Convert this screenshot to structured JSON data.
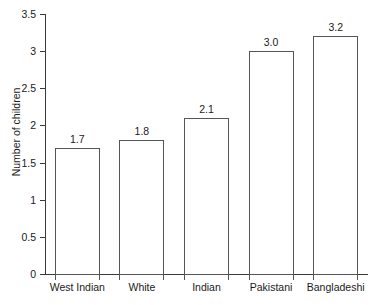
{
  "chart_data": {
    "type": "bar",
    "title": "",
    "xlabel": "",
    "ylabel": "Number of children",
    "categories": [
      "West Indian",
      "White",
      "Indian",
      "Pakistani",
      "Bangladeshi"
    ],
    "values": [
      1.7,
      1.8,
      2.1,
      3.0,
      3.2
    ],
    "value_labels": [
      "1.7",
      "1.8",
      "2.1",
      "3.0",
      "3.2"
    ],
    "ylim": [
      0,
      3.5
    ],
    "ytick_labels": [
      "0",
      "0.5",
      "1",
      "1.5",
      "2",
      "2.5",
      "3",
      "3.5"
    ],
    "ytick_values": [
      0,
      0.5,
      1,
      1.5,
      2,
      2.5,
      3,
      3.5
    ],
    "grid": false,
    "legend": false,
    "bar_fill_color": "#ffffff",
    "bar_border_color": "#555555",
    "axis_color": "#3a3a3a",
    "text_color": "#1a1a1a",
    "background_color": "#ffffff"
  }
}
